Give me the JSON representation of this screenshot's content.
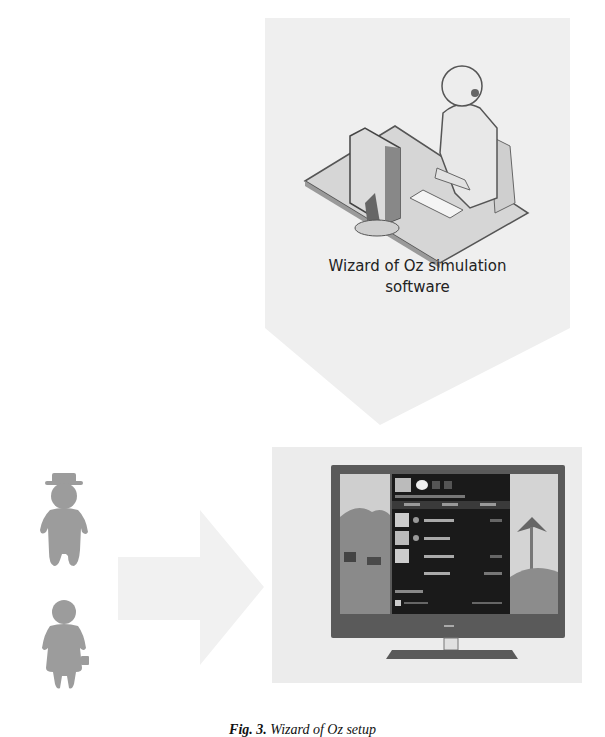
{
  "figure": {
    "wizard": {
      "label_line1": "Wizard of Oz simulation",
      "label_line2": "software",
      "icon": "operator-at-computer-icon"
    },
    "flow": {
      "wizard_to_tv": "down-arrow",
      "users_to_tv": "right-arrow"
    },
    "users": [
      {
        "icon": "elderly-man-with-hat-icon"
      },
      {
        "icon": "elderly-woman-with-handbag-icon"
      }
    ],
    "tv": {
      "icon": "smart-tv-with-menu-icon"
    },
    "caption": {
      "number": "Fig. 3.",
      "text": "Wizard of Oz setup"
    },
    "colors": {
      "panel_bg": "#ececec",
      "figure_gray": "#9a9a9a",
      "tv_bezel": "#555555",
      "tv_menu": "#1a1a1a",
      "text": "#222222"
    }
  }
}
